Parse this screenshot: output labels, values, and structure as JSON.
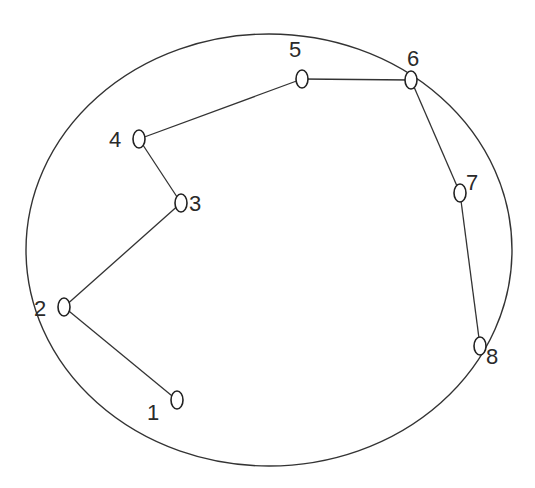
{
  "diagram": {
    "boundary": {
      "shape": "ellipse",
      "cx": 269,
      "cy": 250,
      "rx": 243,
      "ry": 216,
      "stroke": "#333333"
    },
    "nodes": [
      {
        "id": "1",
        "label": "1",
        "x": 177,
        "y": 400,
        "label_x": 147,
        "label_y": 420
      },
      {
        "id": "2",
        "label": "2",
        "x": 64,
        "y": 307,
        "label_x": 34,
        "label_y": 316
      },
      {
        "id": "3",
        "label": "3",
        "x": 181,
        "y": 203,
        "label_x": 189,
        "label_y": 211
      },
      {
        "id": "4",
        "label": "4",
        "x": 139,
        "y": 139,
        "label_x": 109,
        "label_y": 147
      },
      {
        "id": "5",
        "label": "5",
        "x": 302,
        "y": 79,
        "label_x": 289,
        "label_y": 57
      },
      {
        "id": "6",
        "label": "6",
        "x": 411,
        "y": 80,
        "label_x": 407,
        "label_y": 66
      },
      {
        "id": "7",
        "label": "7",
        "x": 460,
        "y": 193,
        "label_x": 466,
        "label_y": 190
      },
      {
        "id": "8",
        "label": "8",
        "x": 480,
        "y": 346,
        "label_x": 486,
        "label_y": 364
      }
    ],
    "edges": [
      {
        "from": "1",
        "to": "2"
      },
      {
        "from": "2",
        "to": "3"
      },
      {
        "from": "3",
        "to": "4"
      },
      {
        "from": "4",
        "to": "5"
      },
      {
        "from": "5",
        "to": "6"
      },
      {
        "from": "6",
        "to": "7"
      },
      {
        "from": "7",
        "to": "8"
      }
    ],
    "node_style": {
      "rx": 6,
      "ry": 9,
      "stroke": "#222222",
      "fill": "#ffffff"
    },
    "edge_color": "#333333"
  }
}
